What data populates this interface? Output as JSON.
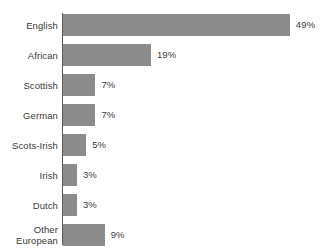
{
  "chart_data": {
    "type": "bar",
    "orientation": "horizontal",
    "title": "",
    "subtitle": "",
    "xlabel": "",
    "ylabel": "",
    "grid": false,
    "legend": "none",
    "axis_range": [
      0,
      49
    ],
    "value_suffix": "%",
    "categories": [
      "English",
      "African",
      "Scottish",
      "German",
      "Scots-Irish",
      "Irish",
      "Dutch",
      "Other\nEuropean"
    ],
    "values": [
      49,
      19,
      7,
      7,
      5,
      3,
      3,
      9
    ],
    "value_labels": [
      "49%",
      "19%",
      "7%",
      "7%",
      "5%",
      "3%",
      "3%",
      "9%"
    ],
    "colors": {
      "bar": "#8c8c8c",
      "axis": "#5b5b5b",
      "text": "#3a3a3a",
      "background": "#ffffff"
    },
    "px_per_unit": 4.63
  }
}
